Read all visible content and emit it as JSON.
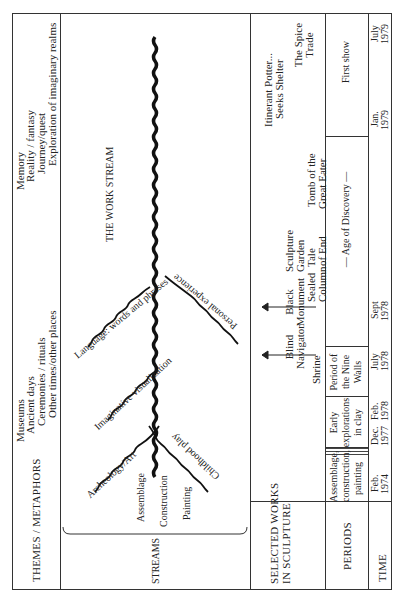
{
  "rows": {
    "themes": {
      "label": "THEMES / METAPHORS",
      "group_a": [
        "Museums",
        "Ancient days",
        "Ceremonies / rituals",
        "Other times/other places"
      ],
      "group_b": [
        "Memory",
        "Reality / fantasy",
        "Journey/quest",
        "Exploration of imaginary realms"
      ]
    },
    "streams": {
      "label": "STREAMS",
      "main_stream_label": "THE WORK STREAM",
      "origins": [
        "Assemblage",
        "Construction",
        "Painting"
      ],
      "branches": [
        {
          "label": "Archeology/Art",
          "side": "upper"
        },
        {
          "label": "Childhood play",
          "side": "lower"
        },
        {
          "label": "Imaginative visualization",
          "side": "upper"
        },
        {
          "label": "Language: words and phrases",
          "side": "upper"
        },
        {
          "label": "Personal experience",
          "side": "lower"
        }
      ]
    },
    "selected_works": {
      "label_line1": "SELECTED WORKS",
      "label_line2": "IN SCULPTURE",
      "works": [
        {
          "lines": [
            "Shrine"
          ]
        },
        {
          "lines": [
            "Blind",
            "Navigator"
          ],
          "arrow": true
        },
        {
          "lines": [
            "Black",
            "Monument"
          ],
          "arrow": true
        },
        {
          "lines": [
            "Sealed",
            "Column"
          ]
        },
        {
          "lines": [
            "Sculpture",
            "Garden",
            "Tale",
            "of End"
          ]
        },
        {
          "lines": [
            "Tomb of the",
            "Great Eater"
          ]
        },
        {
          "lines": [
            "Itinerant Potter...",
            "Seeks Shelter"
          ]
        },
        {
          "lines": [
            "The Spice",
            "Trade"
          ]
        }
      ]
    },
    "periods": {
      "label": "PERIODS",
      "items": [
        {
          "lines": [
            "Assemblage,",
            "construction,",
            "painting"
          ]
        },
        {
          "lines": [
            "Early",
            "explorations",
            "in clay"
          ]
        },
        {
          "lines": [
            "Period of",
            "the Nine",
            "Walls"
          ]
        },
        {
          "lines": [
            "— Age of Discovery —"
          ]
        },
        {
          "lines": [
            "First show"
          ]
        }
      ]
    },
    "time": {
      "label": "TIME",
      "dates": [
        {
          "month": "Feb.",
          "year": "1974"
        },
        {
          "month": "Dec.",
          "year": "1977"
        },
        {
          "month": "Feb.",
          "year": "1978"
        },
        {
          "month": "July",
          "year": "1978"
        },
        {
          "month": "Sept",
          "year": "1978"
        },
        {
          "month": "Jan.",
          "year": "1979"
        },
        {
          "month": "July",
          "year": "1979"
        }
      ]
    }
  },
  "colors": {
    "ink": "#222222",
    "rule": "#333333",
    "paper": "#ffffff"
  }
}
